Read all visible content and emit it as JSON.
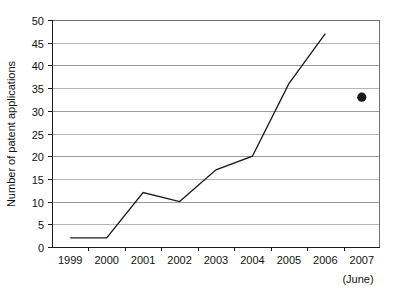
{
  "chart_data": {
    "type": "line",
    "title": "",
    "subtitle": "",
    "xlabel": "",
    "ylabel": "Number of patent applications",
    "categories": [
      "1999",
      "2000",
      "2001",
      "2002",
      "2003",
      "2004",
      "2005",
      "2006",
      "2007"
    ],
    "x_note": "(June)",
    "x_note_category": "2007",
    "ylim": [
      0,
      50
    ],
    "ytick_step": 5,
    "ytick_labels": [
      "0",
      "5",
      "10",
      "15",
      "20",
      "25",
      "30",
      "35",
      "40",
      "45",
      "50"
    ],
    "grid": true,
    "grid_axis": "y",
    "legend": "none",
    "series": [
      {
        "name": "Patent applications (annual)",
        "marker": "diamond",
        "connected": true,
        "color": "#1a1a1a",
        "x": [
          "1999",
          "2000",
          "2001",
          "2002",
          "2003",
          "2004",
          "2005",
          "2006"
        ],
        "values": [
          2,
          2,
          12,
          10,
          17,
          20,
          36,
          47
        ]
      },
      {
        "name": "Patent applications (2007 partial year, to June)",
        "marker": "circle",
        "connected": false,
        "color": "#1a1a1a",
        "x": [
          "2007"
        ],
        "values": [
          33
        ]
      }
    ],
    "annotations": []
  },
  "colors": {
    "axis": "#1a1a1a",
    "grid": "#9a9a9a",
    "grid_minor": "#b5b5b5",
    "series": "#1a1a1a",
    "background": "#ffffff",
    "frame": "#6f6f6f"
  }
}
